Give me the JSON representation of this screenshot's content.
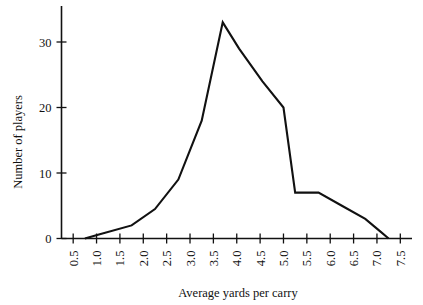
{
  "chart_data": {
    "type": "line",
    "title": "",
    "subtitle": "",
    "xlabel": "Average yards per carry",
    "ylabel": "Number of players",
    "xlim": [
      0.25,
      7.75
    ],
    "ylim": [
      0,
      34
    ],
    "grid": false,
    "legend": "none",
    "x_ticks": [
      "0.5",
      "1.0",
      "1.5",
      "2.0",
      "2.5",
      "3.0",
      "3.5",
      "4.0",
      "4.5",
      "5.0",
      "5.5",
      "6.0",
      "6.5",
      "7.0",
      "7.5"
    ],
    "x_tick_values": [
      0.5,
      1.0,
      1.5,
      2.0,
      2.5,
      3.0,
      3.5,
      4.0,
      4.5,
      5.0,
      5.5,
      6.0,
      6.5,
      7.0,
      7.5
    ],
    "y_ticks": [
      "0",
      "10",
      "20",
      "30"
    ],
    "y_tick_values": [
      0,
      10,
      20,
      30
    ],
    "series": [
      {
        "name": "Number of players",
        "color": "#111111",
        "x": [
          0.75,
          1.05,
          1.75,
          2.25,
          2.75,
          3.25,
          3.7,
          4.05,
          4.55,
          5.0,
          5.25,
          5.75,
          6.25,
          6.75,
          7.05,
          7.25
        ],
        "values": [
          0,
          0.6,
          2.0,
          4.5,
          9.0,
          18.0,
          33.0,
          29.0,
          24.0,
          20.0,
          7.0,
          7.0,
          5.0,
          3.0,
          1.2,
          0
        ]
      }
    ]
  },
  "axes": {
    "y_axis_label": "Number of players",
    "x_axis_label": "Average yards per carry"
  },
  "colors": {
    "line": "#111111",
    "axis": "#111111",
    "background": "#ffffff"
  }
}
